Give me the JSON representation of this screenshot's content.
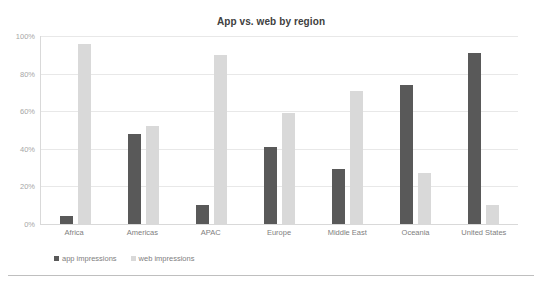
{
  "ghost_text": " ",
  "chart_data": {
    "type": "bar",
    "title": "App vs. web by region",
    "xlabel": "",
    "ylabel": "",
    "ylim": [
      0,
      100
    ],
    "yticks": [
      0,
      20,
      40,
      60,
      80,
      100
    ],
    "ytick_labels": [
      "0%",
      "20%",
      "40%",
      "60%",
      "80%",
      "100%"
    ],
    "grid": true,
    "legend_position": "bottom-left",
    "categories": [
      "Africa",
      "Americas",
      "APAC",
      "Europe",
      "Middle East",
      "Oceania",
      "United States"
    ],
    "series": [
      {
        "name": "app impressions",
        "color": "#595959",
        "values": [
          4,
          48,
          10,
          41,
          29,
          74,
          91
        ]
      },
      {
        "name": "web impressions",
        "color": "#d9d9d9",
        "values": [
          96,
          52,
          90,
          59,
          71,
          27,
          10
        ]
      }
    ]
  }
}
